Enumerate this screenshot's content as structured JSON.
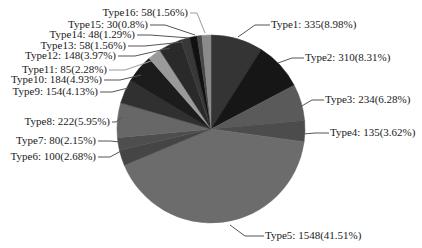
{
  "chart_data": {
    "type": "pie",
    "title": "",
    "start_angle_deg": 90,
    "direction": "clockwise",
    "label_format": "{name}: {value}({percent}%)",
    "total": 3729,
    "slices": [
      {
        "name": "Type1",
        "value": 335,
        "percent": "8.98",
        "color": "#343434"
      },
      {
        "name": "Type2",
        "value": 310,
        "percent": "8.31",
        "color": "#161616"
      },
      {
        "name": "Type3",
        "value": 234,
        "percent": "6.28",
        "color": "#5a5a5a"
      },
      {
        "name": "Type4",
        "value": 135,
        "percent": "3.62",
        "color": "#4c4c4c"
      },
      {
        "name": "Type5",
        "value": 1548,
        "percent": "41.51",
        "color": "#6c6c6c"
      },
      {
        "name": "Type6",
        "value": 100,
        "percent": "2.68",
        "color": "#454545"
      },
      {
        "name": "Type7",
        "value": 80,
        "percent": "2.15",
        "color": "#4e4e4e"
      },
      {
        "name": "Type8",
        "value": 222,
        "percent": "5.95",
        "color": "#676767"
      },
      {
        "name": "Type9",
        "value": 154,
        "percent": "4.13",
        "color": "#303030"
      },
      {
        "name": "Type10",
        "value": 184,
        "percent": "4.93",
        "color": "#1c1c1c"
      },
      {
        "name": "Type11",
        "value": 85,
        "percent": "2.28",
        "color": "#9a9a9a"
      },
      {
        "name": "Type12",
        "value": 148,
        "percent": "3.97",
        "color": "#2a2a2a"
      },
      {
        "name": "Type13",
        "value": 58,
        "percent": "1.56",
        "color": "#383838"
      },
      {
        "name": "Type14",
        "value": 48,
        "percent": "1.29",
        "color": "#111111"
      },
      {
        "name": "Type15",
        "value": 30,
        "percent": "0.8",
        "color": "#484848"
      },
      {
        "name": "Type16",
        "value": 58,
        "percent": "1.56",
        "color": "#8a8a8a"
      }
    ],
    "labels": [
      {
        "text": "Type1: 335(8.98%)",
        "x": 271,
        "y": 28,
        "anchor": "start"
      },
      {
        "text": "Type2: 310(8.31%)",
        "x": 305,
        "y": 61,
        "anchor": "start"
      },
      {
        "text": "Type3: 234(6.28%)",
        "x": 325,
        "y": 103,
        "anchor": "start"
      },
      {
        "text": "Type4: 135(3.62%)",
        "x": 330,
        "y": 136,
        "anchor": "start"
      },
      {
        "text": "Type5: 1548(41.51%)",
        "x": 265,
        "y": 239,
        "anchor": "start"
      },
      {
        "text": "Type6: 100(2.68%)",
        "x": 96,
        "y": 160,
        "anchor": "end"
      },
      {
        "text": "Type7: 80(2.15%)",
        "x": 96,
        "y": 144,
        "anchor": "end"
      },
      {
        "text": "Type8: 222(5.95%)",
        "x": 110,
        "y": 125,
        "anchor": "end"
      },
      {
        "text": "Type9: 154(4.13%)",
        "x": 98,
        "y": 95,
        "anchor": "end"
      },
      {
        "text": "Type10: 184(4.93%)",
        "x": 102,
        "y": 83,
        "anchor": "end"
      },
      {
        "text": "Type11: 85(2.28%)",
        "x": 107,
        "y": 73,
        "anchor": "end"
      },
      {
        "text": "Type12: 148(3.97%)",
        "x": 116,
        "y": 59,
        "anchor": "end"
      },
      {
        "text": "Type13: 58(1.56%)",
        "x": 126,
        "y": 49,
        "anchor": "end"
      },
      {
        "text": "Type14: 48(1.29%)",
        "x": 135,
        "y": 38,
        "anchor": "end"
      },
      {
        "text": "Type15: 30(0.8%)",
        "x": 148,
        "y": 28,
        "anchor": "end"
      },
      {
        "text": "Type16: 58(1.56%)",
        "x": 188,
        "y": 16,
        "anchor": "end"
      }
    ],
    "leaders": [
      {
        "points": "238,37 255,25 270,25"
      },
      {
        "points": "278,63 292,58 304,58"
      },
      {
        "points": "300,107 312,100 324,100"
      },
      {
        "points": "303,134 315,133 329,133"
      },
      {
        "points": "230,225 245,236 264,236"
      },
      {
        "points": "121,151 110,157 98,157"
      },
      {
        "points": "120,142 110,141 98,141"
      },
      {
        "points": "123,117 116,122 112,122"
      },
      {
        "points": "128,88 112,92 100,92"
      },
      {
        "points": "141,75 120,80 104,80"
      },
      {
        "points": "160,58 125,70 109,70"
      },
      {
        "points": "170,48 135,56 118,56"
      },
      {
        "points": "183,42 145,46 128,46"
      },
      {
        "points": "190,38 150,35 137,35"
      },
      {
        "points": "195,35 165,25 150,25"
      },
      {
        "points": "205,33 197,13 190,13"
      }
    ],
    "geometry": {
      "cx": 211,
      "cy": 129,
      "r": 94
    },
    "legend": null
  }
}
